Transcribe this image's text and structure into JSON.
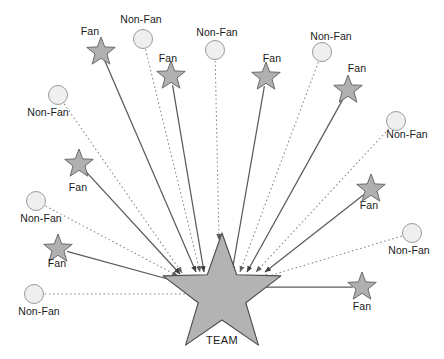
{
  "diagram": {
    "title_text": "",
    "center": {
      "label": "TEAM",
      "shape": "star",
      "cx": 222,
      "cy": 295,
      "outer_r": 62,
      "inner_r": 25,
      "label_x": 222,
      "label_y": 340,
      "fill": "#b3b3b3",
      "stroke": "#4d4d4d"
    },
    "style": {
      "fan_shape": "star",
      "fan_fill": "#b0b0b0",
      "fan_stroke": "#6b6b6b",
      "fan_line_style": "solid",
      "fan_line_color": "#5a5a5a",
      "nonfan_shape": "circle",
      "nonfan_fill": "#efefef",
      "nonfan_stroke": "#9a9a9a",
      "nonfan_line_style": "dotted",
      "nonfan_line_color": "#8a8a8a",
      "arrow_direction": "toward-center",
      "text_color": "#1a1a1a"
    },
    "nodes": [
      {
        "id": "fan-1",
        "type": "fan",
        "label": "Fan",
        "shape_x": 101,
        "shape_y": 52,
        "radius": 15,
        "label_x": 90,
        "label_y": 31,
        "target_x": 196,
        "target_y": 272
      },
      {
        "id": "nonfan-1",
        "type": "nonfan",
        "label": "Non-Fan",
        "shape_x": 143,
        "shape_y": 39,
        "radius": 9.5,
        "label_x": 141,
        "label_y": 19,
        "target_x": 200,
        "target_y": 272
      },
      {
        "id": "fan-2",
        "type": "fan",
        "label": "Fan",
        "shape_x": 171,
        "shape_y": 76,
        "radius": 15,
        "label_x": 168,
        "label_y": 58,
        "target_x": 204,
        "target_y": 272
      },
      {
        "id": "nonfan-2",
        "type": "nonfan",
        "label": "Non-Fan",
        "shape_x": 215,
        "shape_y": 50,
        "radius": 9.5,
        "label_x": 217,
        "label_y": 32,
        "target_x": 219,
        "target_y": 240
      },
      {
        "id": "fan-3",
        "type": "fan",
        "label": "Fan",
        "shape_x": 266,
        "shape_y": 77,
        "radius": 15,
        "label_x": 272,
        "label_y": 58,
        "target_x": 232,
        "target_y": 272
      },
      {
        "id": "nonfan-3",
        "type": "nonfan",
        "label": "Non-Fan",
        "shape_x": 322,
        "shape_y": 52,
        "radius": 9.5,
        "label_x": 331,
        "label_y": 36,
        "target_x": 240,
        "target_y": 272
      },
      {
        "id": "fan-4",
        "type": "fan",
        "label": "Fan",
        "shape_x": 348,
        "shape_y": 90,
        "radius": 15,
        "label_x": 357,
        "label_y": 68,
        "target_x": 247,
        "target_y": 272
      },
      {
        "id": "nonfan-4",
        "type": "nonfan",
        "label": "Non-Fan",
        "shape_x": 396,
        "shape_y": 121,
        "radius": 9.5,
        "label_x": 407,
        "label_y": 134,
        "target_x": 256,
        "target_y": 272
      },
      {
        "id": "nonfan-5",
        "type": "nonfan",
        "label": "Non-Fan",
        "shape_x": 58,
        "shape_y": 95,
        "radius": 9.5,
        "label_x": 48,
        "label_y": 112,
        "target_x": 182,
        "target_y": 273
      },
      {
        "id": "fan-5",
        "type": "fan",
        "label": "Fan",
        "shape_x": 79,
        "shape_y": 164,
        "radius": 15,
        "label_x": 78,
        "label_y": 187,
        "target_x": 180,
        "target_y": 274
      },
      {
        "id": "nonfan-6",
        "type": "nonfan",
        "label": "Non-Fan",
        "shape_x": 36,
        "shape_y": 201,
        "radius": 9.5,
        "label_x": 41,
        "label_y": 218,
        "target_x": 178,
        "target_y": 276
      },
      {
        "id": "fan-6",
        "type": "fan",
        "label": "Fan",
        "shape_x": 58,
        "shape_y": 249,
        "radius": 15,
        "label_x": 57,
        "label_y": 263,
        "target_x": 186,
        "target_y": 284
      },
      {
        "id": "nonfan-7",
        "type": "nonfan",
        "label": "Non-Fan",
        "shape_x": 34,
        "shape_y": 294,
        "radius": 9.5,
        "label_x": 39,
        "label_y": 311,
        "target_x": 198,
        "target_y": 294
      },
      {
        "id": "fan-7",
        "type": "fan",
        "label": "Fan",
        "shape_x": 371,
        "shape_y": 189,
        "radius": 15,
        "label_x": 369,
        "label_y": 205,
        "target_x": 265,
        "target_y": 272
      },
      {
        "id": "nonfan-8",
        "type": "nonfan",
        "label": "Non-Fan",
        "shape_x": 412,
        "shape_y": 233,
        "radius": 9.5,
        "label_x": 409,
        "label_y": 250,
        "target_x": 262,
        "target_y": 278
      },
      {
        "id": "fan-8",
        "type": "fan",
        "label": "Fan",
        "shape_x": 362,
        "shape_y": 287,
        "radius": 15,
        "label_x": 362,
        "label_y": 306,
        "target_x": 248,
        "target_y": 287
      }
    ],
    "counts": {
      "fan_total": "8",
      "nonfan_total": "8",
      "node_total": "16"
    }
  }
}
